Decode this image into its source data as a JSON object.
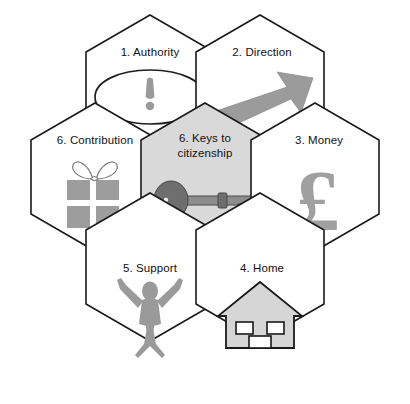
{
  "diagram": {
    "type": "hexagon-honeycomb",
    "title": "",
    "background_color": "#ffffff",
    "outline_color": "#1a1a1a",
    "center_fill_color": "#d9d9d9",
    "cell_fill_color": "#ffffff",
    "icon_color": "#9a9a9a",
    "cells": [
      {
        "id": "authority",
        "number": "1.",
        "label": "1.  Authority",
        "icon": "speech-bubble-exclamation-icon",
        "shaded": false,
        "row": "top",
        "column": "left"
      },
      {
        "id": "direction",
        "number": "2.",
        "label": "2.  Direction",
        "icon": "arrow-up-right-icon",
        "shaded": false,
        "row": "top",
        "column": "right"
      },
      {
        "id": "contribution",
        "number": "6.",
        "label": "6.  Contribution",
        "icon": "gift-box-icon",
        "shaded": false,
        "row": "middle",
        "column": "left"
      },
      {
        "id": "keys-to-citizenship",
        "number": "6.",
        "label_line1": "6.  Keys to",
        "label_line2": "citizenship",
        "label": "6.  Keys to citizenship",
        "icon": "key-icon",
        "shaded": true,
        "row": "middle",
        "column": "center"
      },
      {
        "id": "money",
        "number": "3.",
        "label": "3.  Money",
        "icon": "pound-sterling-icon",
        "icon_glyph": "£",
        "shaded": false,
        "row": "middle",
        "column": "right"
      },
      {
        "id": "support",
        "number": "5.",
        "label": "5.  Support",
        "icon": "person-arms-raised-icon",
        "shaded": false,
        "row": "bottom",
        "column": "left"
      },
      {
        "id": "home",
        "number": "4.",
        "label": "4.  Home",
        "icon": "house-icon",
        "shaded": false,
        "row": "bottom",
        "column": "right"
      }
    ]
  }
}
